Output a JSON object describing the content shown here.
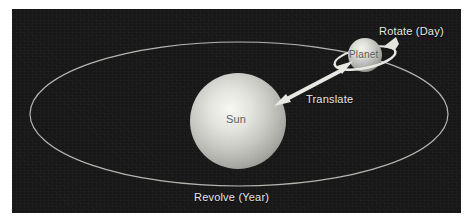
{
  "figure": {
    "panel_background": "#171717",
    "page_background": "#ffffff"
  },
  "bodies": {
    "sun": {
      "label": "Sun",
      "center_x": 238,
      "center_y": 121,
      "radius": 48,
      "highlight_color": "#f2f2ee",
      "body_color": "#b9b9b4",
      "edge_color": "#8d8d88"
    },
    "planet": {
      "label": "Planet",
      "center_x": 365,
      "center_y": 55,
      "radius": 17,
      "highlight_color": "#efefe9",
      "body_color": "#b0b0aa",
      "edge_color": "#84847e"
    }
  },
  "orbits": {
    "revolve": {
      "label": "Revolve (Year)",
      "center_x": 239,
      "center_y": 114,
      "radius_x": 209,
      "radius_y": 72,
      "stroke_color": "#c9c9c4",
      "stroke_width": 1.2
    },
    "rotate": {
      "label": "Rotate (Day)",
      "center_x": 365,
      "center_y": 58,
      "radius_x": 31,
      "radius_y": 10,
      "rotation_deg": -12,
      "stroke_color": "#e4e4df",
      "stroke_width": 2.2,
      "arrow_direction": "counter-clockwise"
    }
  },
  "arrows": {
    "translate": {
      "label": "Translate",
      "from_x": 276,
      "from_y": 103,
      "to_x": 348,
      "to_y": 66,
      "double_headed": true,
      "color": "#e8e8e3",
      "shaft_width": 4
    }
  },
  "labels": {
    "sun": "Sun",
    "planet": "Planet",
    "translate": "Translate",
    "rotate": "Rotate (Day)",
    "revolve": "Revolve (Year)"
  },
  "colors": {
    "panel": "#171717",
    "label_text": "#e8e8e3",
    "body_text": "#5c5c5c",
    "orbit_line": "#c9c9c4",
    "arrow": "#e8e8e3"
  }
}
